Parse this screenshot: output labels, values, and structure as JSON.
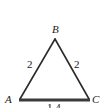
{
  "figure": {
    "type": "geometry-diagram",
    "shape": "triangle",
    "background_color": "#ffffff",
    "stroke_color": "#2b2b2b",
    "text_color": "#1a1a1a",
    "canvas": {
      "width": 107,
      "height": 108
    },
    "vertices": [
      {
        "name": "B",
        "label": "B",
        "x": 55,
        "y": 39
      },
      {
        "name": "A",
        "label": "A",
        "x": 20,
        "y": 99
      },
      {
        "name": "C",
        "label": "C",
        "x": 89,
        "y": 99
      }
    ],
    "sides": [
      {
        "name": "AB",
        "label": "2",
        "from": "A",
        "to": "B",
        "stroke_width": 1.6
      },
      {
        "name": "BC",
        "label": "2",
        "from": "B",
        "to": "C",
        "stroke_width": 1.6
      },
      {
        "name": "AC",
        "label": "1.4",
        "from": "A",
        "to": "C",
        "stroke_width": 3
      }
    ],
    "polygon_points": "20,99 55,39 89,99"
  }
}
